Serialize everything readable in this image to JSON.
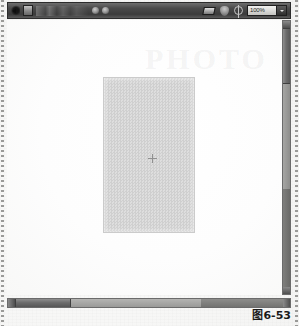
{
  "figure": {
    "caption": "图6-53"
  },
  "app_window": {
    "toolbar": {
      "back_label": "back-arrow",
      "tool_group_label": "tool-preset",
      "options_strip_label": "tool-options",
      "blur_label": "blur-tool",
      "smudge_label": "smudge-tool",
      "layers_label": "layers-palette-toggle",
      "shield_label": "mask-toggle",
      "target_label": "target-alignment-toggle",
      "zoom": {
        "value": "100%",
        "options": [
          "25%",
          "50%",
          "66.7%",
          "100%",
          "200%",
          "400%"
        ]
      }
    },
    "canvas": {
      "watermark": "PHOTO",
      "artwork_label": "transparent-checker-selection",
      "crosshair_label": "center-reference-point"
    },
    "scrollbars": {
      "vertical_label": "vertical-scrollbar",
      "horizontal_label": "horizontal-scrollbar"
    }
  }
}
